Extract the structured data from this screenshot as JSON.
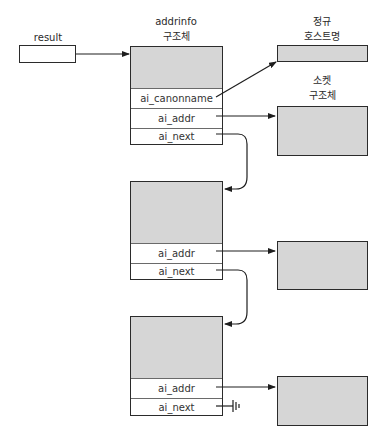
{
  "result": {
    "label": "result"
  },
  "addrinfo_header": {
    "line1": "addrinfo",
    "line2": "구조체"
  },
  "canon_header": {
    "line1": "정규",
    "line2": "호스트명"
  },
  "socket_header": {
    "line1": "소켓",
    "line2": "구조체"
  },
  "structs": [
    {
      "fields": [
        "ai_canonname",
        "ai_addr",
        "ai_next"
      ]
    },
    {
      "fields": [
        "ai_addr",
        "ai_next"
      ]
    },
    {
      "fields": [
        "ai_addr",
        "ai_next"
      ]
    }
  ],
  "colors": {
    "fill": "#d6d6d6",
    "stroke": "#2b2b2b",
    "background": "#ffffff"
  }
}
